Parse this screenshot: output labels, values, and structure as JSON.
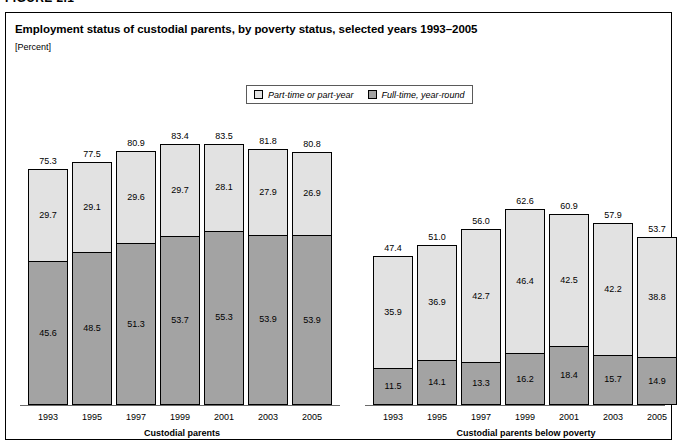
{
  "figure": {
    "number_label": "FIGURE 2.1",
    "title": "Employment status of custodial parents, by poverty status, selected years 1993–2005",
    "unit_label": "[Percent]"
  },
  "legend": {
    "items": [
      {
        "label": "Part-time or part-year",
        "color": "#e2e2e2",
        "key": "part_time"
      },
      {
        "label": "Full-time, year-round",
        "color": "#a3a3a3",
        "key": "full_time"
      }
    ]
  },
  "chart_data": {
    "type": "bar",
    "title": "Employment status of custodial parents, by poverty status, selected years 1993–2005",
    "subtitle": "[Percent]",
    "xlabel": "",
    "ylabel": "Percent",
    "ylim": [
      0,
      90
    ],
    "grid": false,
    "stacked": true,
    "legend_position": "top-center",
    "panels": [
      {
        "name": "custodial-parents",
        "caption": "Custodial parents",
        "categories": [
          "1993",
          "1995",
          "1997",
          "1999",
          "2001",
          "2003",
          "2005"
        ],
        "series": [
          {
            "name": "Full-time, year-round",
            "values": [
              45.6,
              48.5,
              51.3,
              53.7,
              55.3,
              53.9,
              53.9
            ]
          },
          {
            "name": "Part-time or part-year",
            "values": [
              29.7,
              29.1,
              29.6,
              29.7,
              28.1,
              27.9,
              26.9
            ]
          }
        ],
        "totals": [
          75.3,
          77.5,
          80.9,
          83.4,
          83.5,
          81.8,
          80.8
        ]
      },
      {
        "name": "custodial-parents-below-poverty",
        "caption": "Custodial parents below poverty",
        "categories": [
          "1993",
          "1995",
          "1997",
          "1999",
          "2001",
          "2003",
          "2005"
        ],
        "series": [
          {
            "name": "Full-time, year-round",
            "values": [
              11.5,
              14.1,
              13.3,
              16.2,
              18.4,
              15.7,
              14.9
            ]
          },
          {
            "name": "Part-time or part-year",
            "values": [
              35.9,
              36.9,
              42.7,
              46.4,
              42.5,
              42.2,
              38.8
            ]
          }
        ],
        "totals": [
          47.4,
          51.0,
          56.0,
          62.6,
          60.9,
          57.9,
          53.7
        ]
      }
    ]
  }
}
